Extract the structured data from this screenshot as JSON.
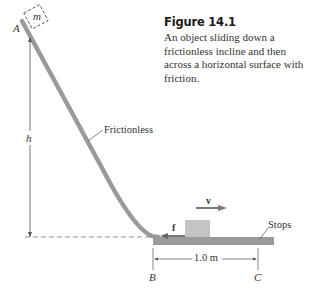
{
  "figure": {
    "title": "Figure 14.1",
    "caption": "An object sliding down a frictionless incline and then across a horizontal surface with friction."
  },
  "labels": {
    "point_a": "A",
    "mass": "m",
    "height": "h",
    "incline": "Frictionless",
    "velocity": "v⃗",
    "friction": "f⃗",
    "stops": "Stops",
    "distance": "1.0 m",
    "point_b": "B",
    "point_c": "C"
  },
  "colors": {
    "surface": "#9a9a9a",
    "block": "#c4c4c4",
    "arrow": "#777777",
    "line": "#555555"
  }
}
